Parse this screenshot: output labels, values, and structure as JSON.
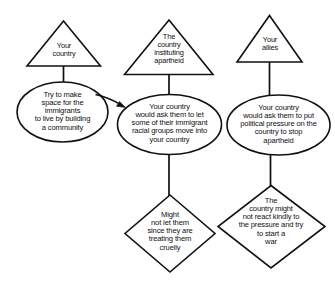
{
  "diagram": {
    "style": {
      "background": "#ffffff",
      "stroke": "#111111",
      "text": "#111111"
    },
    "nodes": [
      {
        "id": "tri-your-country",
        "shape": "triangle",
        "label": "Your\ncountry"
      },
      {
        "id": "tri-country-apartheid",
        "shape": "triangle",
        "label": "The\ncountry\ninstituting\napartheid"
      },
      {
        "id": "tri-your-allies",
        "shape": "triangle",
        "label": "Your\nallies"
      },
      {
        "id": "ell-make-space",
        "shape": "ellipse",
        "label": "Try to make\nspace for the\nimmigrants\nto live by building\na community"
      },
      {
        "id": "ell-ask-move-immigrants",
        "shape": "ellipse",
        "label": "Your country\nwould ask them to let\nsome of their immigrant\nracial groups move into\nyour country"
      },
      {
        "id": "ell-ask-political-pressure",
        "shape": "ellipse",
        "label": "Your country\nwould ask them to put\npolitical pressure on the\ncountry to stop\napartheid"
      },
      {
        "id": "dia-might-not-let",
        "shape": "diamond",
        "label": "Might\nnot let them\nsince they are\ntreating them\ncruelly"
      },
      {
        "id": "dia-not-react-kindly",
        "shape": "diamond",
        "label": "The\ncountry might\nnot react kindly to\nthe pressure and try\nto start a\nwar"
      }
    ],
    "edges": [
      {
        "id": "edge-your-country-to-make-space",
        "from": "tri-your-country",
        "to": "ell-make-space",
        "type": "line"
      },
      {
        "id": "edge-apartheid-to-ask-move",
        "from": "tri-country-apartheid",
        "to": "ell-ask-move-immigrants",
        "type": "line"
      },
      {
        "id": "edge-allies-to-ask-pressure",
        "from": "tri-your-allies",
        "to": "ell-ask-political-pressure",
        "type": "line"
      },
      {
        "id": "edge-make-space-to-ask-move",
        "from": "ell-make-space",
        "to": "ell-ask-move-immigrants",
        "type": "arrow"
      },
      {
        "id": "edge-ask-move-to-might-not-let",
        "from": "ell-ask-move-immigrants",
        "to": "dia-might-not-let",
        "type": "line"
      },
      {
        "id": "edge-ask-pressure-to-not-react",
        "from": "ell-ask-political-pressure",
        "to": "dia-not-react-kindly",
        "type": "line"
      }
    ]
  }
}
